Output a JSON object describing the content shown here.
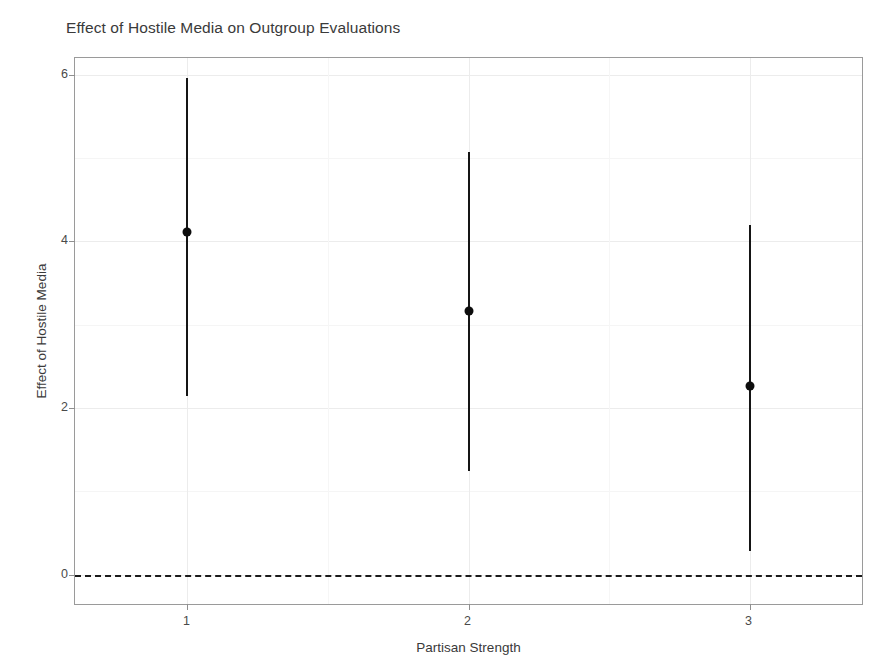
{
  "chart_data": {
    "type": "scatter",
    "title": "Effect of Hostile Media on Outgroup Evaluations",
    "subtitle": "",
    "xlabel": "Partisan Strength",
    "ylabel": "Effect of Hostile Media",
    "x": [
      1,
      2,
      3
    ],
    "categories": [
      "1",
      "2",
      "3"
    ],
    "xtick_labels": [
      "1",
      "2",
      "3"
    ],
    "ytick_labels": [
      "0",
      "2",
      "4",
      "6"
    ],
    "ytick_values": [
      0,
      2,
      4,
      6
    ],
    "values": [
      4.11,
      3.17,
      2.27
    ],
    "ci_lower": [
      2.14,
      1.24,
      0.29
    ],
    "ci_upper": [
      5.96,
      5.07,
      4.2
    ],
    "series": [
      {
        "name": "Effect of Hostile Media",
        "values": [
          4.11,
          3.17,
          2.27
        ],
        "ci_lower": [
          2.14,
          1.24,
          0.29
        ],
        "ci_upper": [
          5.96,
          5.07,
          4.2
        ]
      }
    ],
    "points": [
      {
        "x": 1,
        "estimate": 4.11,
        "lower": 2.14,
        "upper": 5.96
      },
      {
        "x": 2,
        "estimate": 3.17,
        "lower": 1.24,
        "upper": 5.07
      },
      {
        "x": 3,
        "estimate": 2.27,
        "lower": 0.29,
        "upper": 4.2
      }
    ],
    "xlim": [
      0.6,
      3.4
    ],
    "ylim": [
      -0.35,
      6.2
    ],
    "grid": true,
    "legend": false,
    "legend_position": "none",
    "reference_line": {
      "y": 0,
      "style": "dashed",
      "color": "#1a1a1a"
    },
    "marker": "filled-circle",
    "errorbar_style": "vertical-line-no-caps",
    "colors": {
      "marker": "#0d0d0d",
      "errorbar": "#151515",
      "panel_border": "#9a9a9a",
      "gridline": "#ececec",
      "background": "#ffffff",
      "text": "#3a3a3a"
    }
  }
}
